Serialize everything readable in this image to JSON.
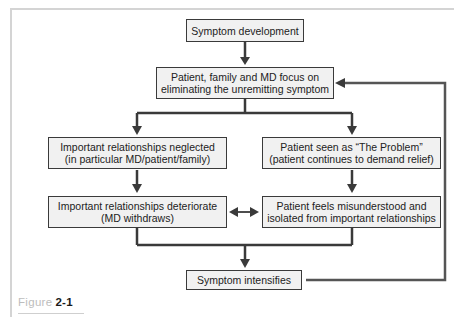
{
  "diagram": {
    "type": "flowchart",
    "nodes": {
      "n1": {
        "id": "n1",
        "lines": [
          "Symptom development"
        ]
      },
      "n2": {
        "id": "n2",
        "lines": [
          "Patient, family and MD focus on",
          "eliminating the unremitting symptom"
        ]
      },
      "n3": {
        "id": "n3",
        "lines": [
          "Important relationships neglected",
          "(in particular MD/patient/family)"
        ]
      },
      "n4": {
        "id": "n4",
        "lines": [
          "Patient seen as “The Problem”",
          "(patient continues to demand relief)"
        ]
      },
      "n5": {
        "id": "n5",
        "lines": [
          "Important relationships deteriorate",
          "(MD withdraws)"
        ]
      },
      "n6": {
        "id": "n6",
        "lines": [
          "Patient feels misunderstood and",
          "isolated from important relationships"
        ]
      },
      "n7": {
        "id": "n7",
        "lines": [
          "Symptom intensifies"
        ]
      }
    },
    "edges": [
      {
        "from": "n1",
        "to": "n2",
        "type": "arrow"
      },
      {
        "from": "n2",
        "to": "n3",
        "type": "arrow-branch"
      },
      {
        "from": "n2",
        "to": "n4",
        "type": "arrow-branch"
      },
      {
        "from": "n3",
        "to": "n5",
        "type": "arrow"
      },
      {
        "from": "n4",
        "to": "n6",
        "type": "arrow"
      },
      {
        "from": "n5",
        "to": "n6",
        "type": "double-arrow"
      },
      {
        "from": "n5",
        "to": "n7",
        "type": "arrow-merge"
      },
      {
        "from": "n6",
        "to": "n7",
        "type": "arrow-merge"
      },
      {
        "from": "n7",
        "to": "n2",
        "type": "feedback-arrow"
      }
    ],
    "colors": {
      "line": "#3a3a3a",
      "box_fill": "#f1f1f1",
      "frame": "#d4d4d4"
    }
  },
  "caption": {
    "label": "Figure",
    "number": "2-1"
  }
}
